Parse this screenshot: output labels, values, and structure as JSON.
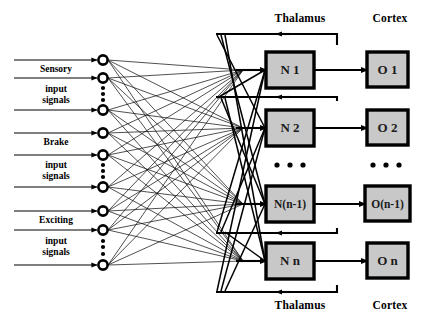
{
  "diagram": {
    "type": "block-diagram",
    "background_color": "#ffffff",
    "line_color": "#000000",
    "box_fill_color": "#c8c8c8",
    "box_border_color": "#000000"
  },
  "headers": {
    "top_left": "Thalamus",
    "top_right": "Cortex",
    "bottom_left": "Thalamus",
    "bottom_right": "Cortex"
  },
  "input_groups": [
    {
      "name": "Sensory",
      "line1": "Sensory",
      "line2": "input",
      "line3": "signals"
    },
    {
      "name": "Brake",
      "line1": "Brake",
      "line2": "input",
      "line3": "signals"
    },
    {
      "name": "Exciting",
      "line1": "Exciting",
      "line2": "input",
      "line3": "signals"
    }
  ],
  "input_nodes": [
    {
      "id": "in-1",
      "cy": 60,
      "has_arrow": true,
      "ellipsis_below": false
    },
    {
      "id": "in-2",
      "cy": 78,
      "has_arrow": true,
      "ellipsis_below": true
    },
    {
      "id": "in-3",
      "cy": 110,
      "has_arrow": true,
      "ellipsis_below": false
    },
    {
      "id": "in-4",
      "cy": 133,
      "has_arrow": true,
      "ellipsis_below": false
    },
    {
      "id": "in-5",
      "cy": 155,
      "has_arrow": true,
      "ellipsis_below": true
    },
    {
      "id": "in-6",
      "cy": 187,
      "has_arrow": true,
      "ellipsis_below": false
    },
    {
      "id": "in-7",
      "cy": 211,
      "has_arrow": true,
      "ellipsis_below": false
    },
    {
      "id": "in-8",
      "cy": 230,
      "has_arrow": true,
      "ellipsis_below": true
    },
    {
      "id": "in-9",
      "cy": 265,
      "has_arrow": true,
      "ellipsis_below": false
    }
  ],
  "thalamus_neurons": [
    {
      "id": "N1",
      "label": "N 1",
      "x": 266,
      "y": 52,
      "w": 48,
      "h": 36,
      "font_size": 13
    },
    {
      "id": "N2",
      "label": "N 2",
      "x": 266,
      "y": 110,
      "w": 48,
      "h": 36,
      "font_size": 13
    },
    {
      "id": "Nn-1",
      "label": "N(n-1)",
      "x": 266,
      "y": 186,
      "w": 48,
      "h": 36,
      "font_size": 11.5
    },
    {
      "id": "Nn",
      "label": "N n",
      "x": 266,
      "y": 243,
      "w": 48,
      "h": 36,
      "font_size": 13
    }
  ],
  "cortex_outputs": [
    {
      "id": "O1",
      "label": "O 1",
      "x": 367,
      "y": 52,
      "w": 41,
      "h": 35,
      "font_size": 13
    },
    {
      "id": "O2",
      "label": "O 2",
      "x": 367,
      "y": 110,
      "w": 41,
      "h": 35,
      "font_size": 13
    },
    {
      "id": "On-1",
      "label": "O(n-1)",
      "x": 365,
      "y": 186,
      "w": 45,
      "h": 35,
      "font_size": 11.5
    },
    {
      "id": "On",
      "label": "O n",
      "x": 367,
      "y": 243,
      "w": 41,
      "h": 35,
      "font_size": 13
    }
  ],
  "ellipsis": {
    "neuron_column": {
      "cx": 290,
      "cy": 165,
      "count": 3
    },
    "output_column": {
      "cx": 387,
      "cy": 165,
      "count": 3
    }
  },
  "connection_summary": {
    "input_to_thalamus": "fully connected (9 inputs x 4 neurons)",
    "thalamus_to_cortex": "one-to-one feedforward",
    "cortex_to_thalamus": "feedback via thalamic return paths"
  }
}
